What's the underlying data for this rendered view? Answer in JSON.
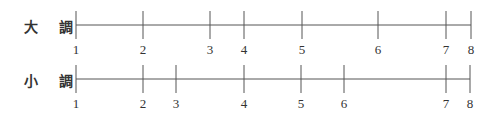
{
  "rows": [
    {
      "label": "大 調",
      "line_y": 25,
      "ticks": [
        {
          "n": "1",
          "x": 76
        },
        {
          "n": "2",
          "x": 143
        },
        {
          "n": "3",
          "x": 210
        },
        {
          "n": "4",
          "x": 244
        },
        {
          "n": "5",
          "x": 302
        },
        {
          "n": "6",
          "x": 378
        },
        {
          "n": "7",
          "x": 446
        },
        {
          "n": "8",
          "x": 471
        }
      ]
    },
    {
      "label": "小 調",
      "line_y": 79,
      "ticks": [
        {
          "n": "1",
          "x": 76
        },
        {
          "n": "2",
          "x": 143
        },
        {
          "n": "3",
          "x": 176
        },
        {
          "n": "4",
          "x": 244
        },
        {
          "n": "5",
          "x": 301
        },
        {
          "n": "6",
          "x": 344
        },
        {
          "n": "7",
          "x": 446
        },
        {
          "n": "8",
          "x": 470
        }
      ]
    }
  ],
  "colors": {
    "line": "#555555",
    "text": "#333333"
  }
}
